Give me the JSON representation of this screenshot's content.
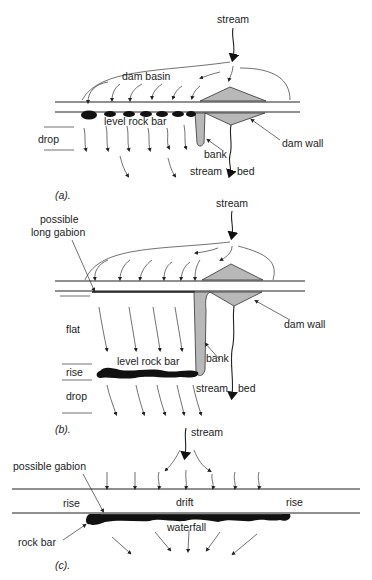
{
  "figure": {
    "panel_a": {
      "caption": "(a).",
      "labels": {
        "stream": "stream",
        "dam_basin": "dam basin",
        "level_rock_bar": "level rock bar",
        "drop": "drop",
        "bank": "bank",
        "dam_wall": "dam wall",
        "stream_left": "stream",
        "bed": "bed"
      }
    },
    "panel_b": {
      "caption": "(b).",
      "labels": {
        "stream": "stream",
        "possible_long_gabion_1": "possible",
        "possible_long_gabion_2": "long gabion",
        "dam_wall": "dam wall",
        "flat": "flat",
        "level_rock_bar": "level rock bar",
        "bank": "bank",
        "rise": "rise",
        "drop": "drop",
        "stream_left": "stream",
        "bed": "bed"
      }
    },
    "panel_c": {
      "caption": "(c).",
      "labels": {
        "stream": "stream",
        "possible_gabion": "possible gabion",
        "rise_left": "rise",
        "drift": "drift",
        "rise_right": "rise",
        "waterfall": "waterfall",
        "rock_bar": "rock bar"
      }
    },
    "colors": {
      "line": "#222222",
      "fill_grey": "#b8b8b8",
      "rock": "#111111"
    }
  }
}
